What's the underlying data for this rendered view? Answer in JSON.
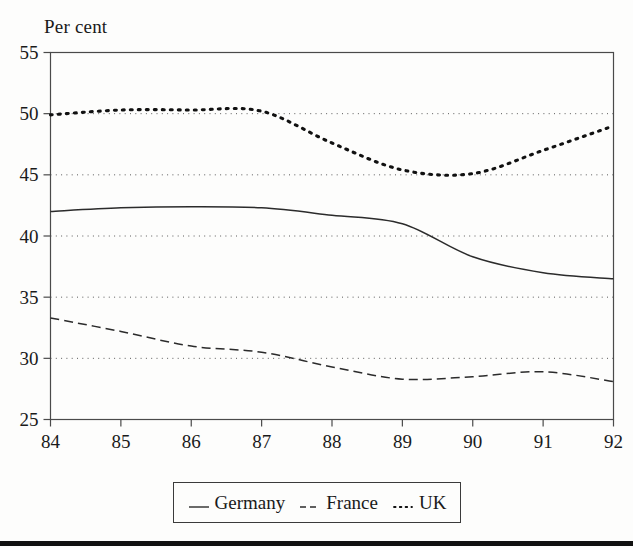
{
  "chart_data": {
    "type": "line",
    "title": "Per cent",
    "xlabel": "",
    "ylabel": "Per cent",
    "xlim": [
      84,
      92
    ],
    "ylim": [
      25,
      55
    ],
    "grid": true,
    "grid_axis": "y",
    "legend_position": "bottom",
    "xticks": [
      "84",
      "85",
      "86",
      "87",
      "88",
      "89",
      "90",
      "91",
      "92"
    ],
    "yticks": [
      "25",
      "30",
      "35",
      "40",
      "45",
      "50",
      "55"
    ],
    "x": [
      84,
      85,
      86,
      87,
      88,
      89,
      90,
      91,
      92
    ],
    "series": [
      {
        "name": "Germany",
        "style": "solid",
        "color": "#2b2b2b",
        "values": [
          42.0,
          42.3,
          42.4,
          42.3,
          41.7,
          41.0,
          38.3,
          37.0,
          36.5
        ]
      },
      {
        "name": "France",
        "style": "dashed",
        "color": "#2b2b2b",
        "values": [
          33.3,
          32.2,
          31.0,
          30.5,
          29.3,
          28.3,
          28.5,
          28.9,
          28.1
        ]
      },
      {
        "name": "UK",
        "style": "dotted",
        "color": "#111111",
        "values": [
          49.9,
          50.3,
          50.3,
          50.2,
          47.6,
          45.4,
          45.1,
          47.0,
          49.0
        ]
      }
    ]
  },
  "legend": {
    "entries": [
      {
        "label": "Germany",
        "marker": "solid-line-swatch"
      },
      {
        "label": "France",
        "marker": "dashed-line-swatch"
      },
      {
        "label": "UK",
        "marker": "dotted-line-swatch"
      }
    ]
  },
  "axes": {
    "title": "Per cent"
  }
}
